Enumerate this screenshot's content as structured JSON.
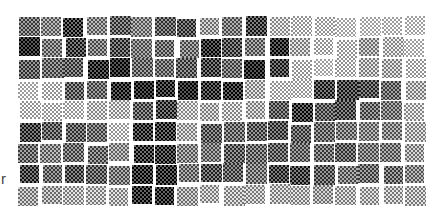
{
  "figure": {
    "label": "r",
    "tones": [
      [
        0.55,
        0.45,
        0.75,
        0.45,
        0.6,
        0.45,
        0.6,
        0.65,
        0.35,
        0.5,
        0.7,
        0.25,
        0.2,
        0.2,
        0.15,
        0.15,
        0.15,
        0.15
      ],
      [
        0.85,
        0.5,
        0.7,
        0.5,
        0.65,
        0.5,
        0.55,
        0.5,
        0.8,
        0.65,
        0.5,
        0.8,
        0.3,
        0.2,
        0.2,
        0.35,
        0.25,
        0.15
      ],
      [
        0.6,
        0.55,
        0.6,
        0.8,
        0.85,
        0.55,
        0.55,
        0.6,
        0.7,
        0.55,
        0.85,
        0.7,
        0.2,
        0.15,
        0.2,
        0.3,
        0.3,
        0.2
      ],
      [
        0.15,
        0.2,
        0.6,
        0.55,
        0.8,
        0.85,
        0.8,
        0.85,
        0.75,
        0.8,
        0.3,
        0.2,
        0.2,
        0.7,
        0.7,
        0.65,
        0.55,
        0.3
      ],
      [
        0.2,
        0.2,
        0.2,
        0.25,
        0.25,
        0.6,
        0.7,
        0.25,
        0.3,
        0.25,
        0.3,
        0.6,
        0.75,
        0.6,
        0.65,
        0.55,
        0.5,
        0.25
      ],
      [
        0.7,
        0.6,
        0.6,
        0.55,
        0.2,
        0.75,
        0.75,
        0.3,
        0.6,
        0.55,
        0.6,
        0.65,
        0.6,
        0.55,
        0.5,
        0.45,
        0.45,
        0.3
      ],
      [
        0.55,
        0.45,
        0.55,
        0.55,
        0.4,
        0.75,
        0.75,
        0.45,
        0.5,
        0.6,
        0.55,
        0.6,
        0.55,
        0.55,
        0.6,
        0.5,
        0.5,
        0.35
      ],
      [
        0.7,
        0.55,
        0.65,
        0.6,
        0.5,
        0.8,
        0.8,
        0.5,
        0.65,
        0.6,
        0.5,
        0.7,
        0.7,
        0.6,
        0.5,
        0.55,
        0.55,
        0.45
      ],
      [
        0.35,
        0.35,
        0.3,
        0.3,
        0.3,
        0.8,
        0.8,
        0.35,
        0.3,
        0.3,
        0.3,
        0.3,
        0.3,
        0.35,
        0.3,
        0.3,
        0.3,
        0.3
      ]
    ]
  }
}
